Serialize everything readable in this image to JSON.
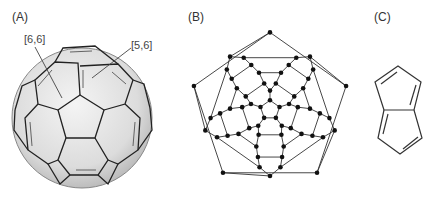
{
  "panels": [
    {
      "id": "A",
      "label": "(A)",
      "description": "C60 fullerene ball model",
      "callouts": [
        "[6,6]",
        "[5,6]"
      ]
    },
    {
      "id": "B",
      "label": "(B)",
      "description": "Schlegel diagram of C60"
    },
    {
      "id": "C",
      "label": "(C)",
      "description": "Pentalene structure"
    }
  ],
  "colors": {
    "line": "#222222",
    "ball_fill": "#e6e6e6",
    "ball_shade": "#c9c9c9",
    "text": "#333333"
  }
}
